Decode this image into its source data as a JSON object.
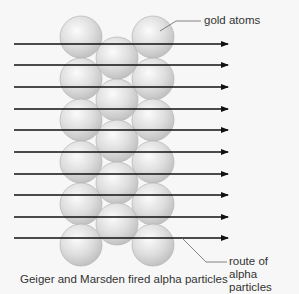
{
  "diagram": {
    "title": "Geiger and Marsden fired alpha particles",
    "labels": {
      "gold_atoms": "gold atoms",
      "route": "route of alpha particles"
    },
    "caption": "Geiger and Marsden fired alpha particles",
    "atoms": {
      "radius": 21,
      "columns": [
        {
          "x": 81,
          "y": [
            37,
            79,
            120,
            162,
            204,
            245
          ]
        },
        {
          "x": 117,
          "y": [
            58,
            100,
            141,
            183,
            224
          ]
        },
        {
          "x": 153,
          "y": [
            37,
            79,
            120,
            162,
            204,
            245
          ]
        }
      ]
    },
    "arrows": {
      "count": 10,
      "x_start": 14,
      "x_end": 228,
      "y": [
        44,
        65,
        87,
        109,
        130,
        152,
        174,
        195,
        217,
        238
      ]
    },
    "colors": {
      "background": "#f7f7f7",
      "atom_fill": "#d9d9d9",
      "atom_stroke": "#b5b5b5",
      "arrow": "#111111",
      "leader": "#666666",
      "text": "#333333"
    }
  }
}
